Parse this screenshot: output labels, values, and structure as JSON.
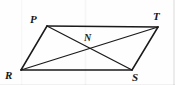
{
  "figure": {
    "kind": "geometry-diagram",
    "shape_name": "parallelogram",
    "canvas": {
      "width": 175,
      "height": 85
    },
    "background_color": "#fefefe",
    "stroke_color": "#1a1a1a",
    "label_color": "#161616",
    "vertices": [
      {
        "id": "P",
        "label": "P",
        "x": 47,
        "y": 26,
        "label_x": 30,
        "label_y": 14
      },
      {
        "id": "T",
        "label": "T",
        "x": 158,
        "y": 27,
        "label_x": 153,
        "label_y": 11
      },
      {
        "id": "S",
        "label": "S",
        "x": 132,
        "y": 70,
        "label_x": 132,
        "label_y": 72
      },
      {
        "id": "R",
        "label": "R",
        "x": 21,
        "y": 70,
        "label_x": 5,
        "label_y": 70
      }
    ],
    "interior_points": [
      {
        "id": "N",
        "label": "N",
        "x": 89,
        "y": 48,
        "label_x": 84,
        "label_y": 33
      }
    ],
    "sides": [
      {
        "id": "PT",
        "from": "P",
        "to": "T",
        "x1": 47,
        "y1": 26,
        "x2": 158,
        "y2": 27
      },
      {
        "id": "TS",
        "from": "T",
        "to": "S",
        "x1": 158,
        "y1": 27,
        "x2": 132,
        "y2": 70
      },
      {
        "id": "SR",
        "from": "S",
        "to": "R",
        "x1": 132,
        "y1": 70,
        "x2": 21,
        "y2": 70
      },
      {
        "id": "RP",
        "from": "R",
        "to": "P",
        "x1": 21,
        "y1": 70,
        "x2": 47,
        "y2": 26
      }
    ],
    "diagonals": [
      {
        "id": "PS",
        "from": "P",
        "to": "S",
        "x1": 47,
        "y1": 26,
        "x2": 132,
        "y2": 70
      },
      {
        "id": "RT",
        "from": "R",
        "to": "T",
        "x1": 21,
        "y1": 70,
        "x2": 158,
        "y2": 27
      }
    ]
  }
}
